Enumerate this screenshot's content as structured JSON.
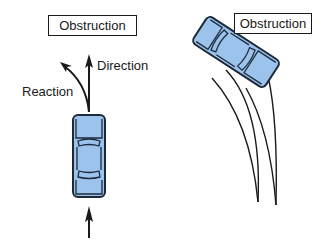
{
  "left_scene": {
    "obstruction_label": "Obstruction",
    "direction_label": "Direction",
    "reaction_label": "Reaction"
  },
  "right_scene": {
    "obstruction_label": "Obstruction"
  },
  "colors": {
    "car_fill": "#9cc3ec",
    "car_outline": "#1c2a3a",
    "line": "#1a1a1a",
    "background": "#ffffff"
  }
}
